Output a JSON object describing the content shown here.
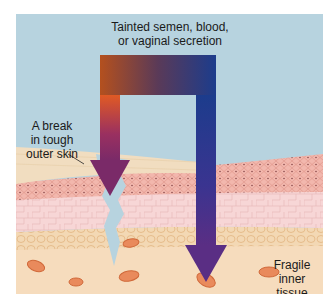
{
  "diagram": {
    "labels": {
      "source": "Tainted semen, blood, or vaginal secretion",
      "source_line1": "Tainted semen, blood,",
      "source_line2": "or vaginal secretion",
      "break_line1": "A break",
      "break_line2": "in tough",
      "break_line3": "outer skin",
      "inner_line1": "Fragile",
      "inner_line2": "inner",
      "inner_line3": "tissue"
    },
    "colors": {
      "background": "#b7d3df",
      "keratin_layer": "#f0dcc0",
      "dense_cell_layer": "#f2b3aa",
      "epidermis": "#f6d4d4",
      "basal_layer": "#f3d6b0",
      "inner_tissue": "#f6dcbd",
      "blood_cell": "#e8875a",
      "arrow_orange": "#d4582a",
      "arrow_blue": "#1d3a8a",
      "arrow_purple": "#6a2a78"
    },
    "arrows": [
      {
        "name": "break-path",
        "description": "Path through break in outer skin"
      },
      {
        "name": "inner-tissue-path",
        "description": "Path directly into fragile inner tissue"
      }
    ]
  }
}
